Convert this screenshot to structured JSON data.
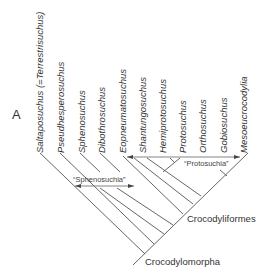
{
  "panel_letter": "A",
  "taxa": [
    {
      "name": "Saltaposuchus (=Terrestrisuchus)",
      "x": 40
    },
    {
      "name": "Pseudhesperosuchus",
      "x": 62
    },
    {
      "name": "Sphenosuchus",
      "x": 83
    },
    {
      "name": "Dibothrosuchus",
      "x": 104
    },
    {
      "name": "Eopneumatosuchus",
      "x": 124
    },
    {
      "name": "Shantungosuchus",
      "x": 144
    },
    {
      "name": "Hemiprotosuchus",
      "x": 165
    },
    {
      "name": "Protosuchus",
      "x": 185
    },
    {
      "name": "Orthosuchus",
      "x": 206
    },
    {
      "name": "Gobiosuchus",
      "x": 226
    },
    {
      "name": "Mesoeucrocodylia",
      "x": 247
    }
  ],
  "clades": {
    "crocodyliformes": "Crocodyliformes",
    "crocodylomorpha": "Crocodylomorpha"
  },
  "groups": {
    "sphenosuchia": "“Sphenosuchia”",
    "protosuchia": "“Protosuchia”"
  },
  "colors": {
    "line": "#555555",
    "text": "#333333"
  }
}
